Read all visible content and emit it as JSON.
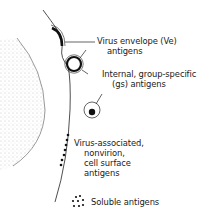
{
  "labels": {
    "envelope": [
      "Virus envelope (Ve)",
      "antigens"
    ],
    "internal": [
      "Internal, group-specific",
      "(gs) antigens"
    ],
    "nonvirion": [
      "Virus-associated,",
      "nonvirion,",
      "cell surface",
      "antigens"
    ],
    "soluble": "Soluble antigens"
  },
  "colors": {
    "ink": "#1a1a1a",
    "stipple": "#9a9a9a",
    "background": "#ffffff"
  }
}
